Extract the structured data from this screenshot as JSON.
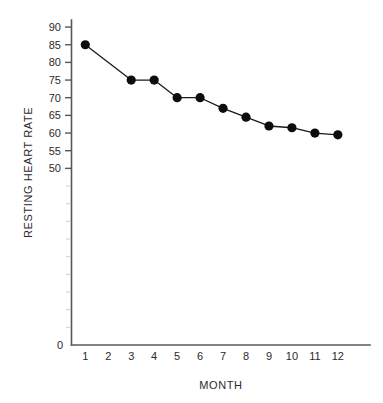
{
  "chart_data": {
    "type": "line",
    "title": "",
    "xlabel": "MONTH",
    "ylabel": "RESTING HEART RATE",
    "x": [
      1,
      3,
      4,
      5,
      6,
      7,
      8,
      9,
      10,
      11,
      12
    ],
    "values": [
      85,
      75,
      75,
      70,
      70,
      67,
      64.5,
      62,
      61.5,
      60,
      59.5
    ],
    "series": [
      {
        "name": "Resting Heart Rate",
        "points": [
          {
            "x": 1,
            "y": 85
          },
          {
            "x": 3,
            "y": 75
          },
          {
            "x": 4,
            "y": 75
          },
          {
            "x": 5,
            "y": 70
          },
          {
            "x": 6,
            "y": 70
          },
          {
            "x": 7,
            "y": 67
          },
          {
            "x": 8,
            "y": 64.5
          },
          {
            "x": 9,
            "y": 62
          },
          {
            "x": 10,
            "y": 61.5
          },
          {
            "x": 11,
            "y": 60
          },
          {
            "x": 12,
            "y": 59.5
          }
        ],
        "color": "#0d0d0d",
        "marker": "filled-circle"
      }
    ],
    "xticks": [
      1,
      2,
      3,
      4,
      5,
      6,
      7,
      8,
      9,
      10,
      11,
      12
    ],
    "xtick_labels": [
      "1",
      "2",
      "3",
      "4",
      "5",
      "6",
      "7",
      "8",
      "9",
      "10",
      "11",
      "12"
    ],
    "yticks": [
      90,
      85,
      80,
      75,
      70,
      65,
      60,
      55,
      50
    ],
    "ytick_labels": [
      "90",
      "85",
      "80",
      "75",
      "70",
      "65",
      "60",
      "55",
      "50"
    ],
    "y_origin_label": "0",
    "ylim": [
      0,
      92
    ],
    "xlim": [
      0.4,
      13.4
    ],
    "grid": false,
    "legend": false,
    "note": "No data point plotted at month 2; line connects month 1 directly to month 3."
  },
  "axes": {
    "x_label": "MONTH",
    "y_label": "RESTING HEART RATE"
  }
}
